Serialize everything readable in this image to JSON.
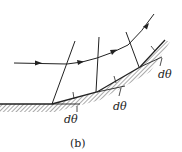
{
  "figure": {
    "caption": "(b)",
    "angle_labels": [
      "dθ",
      "dθ",
      "dθ"
    ],
    "colors": {
      "line": "#222222",
      "hatch": "#555555",
      "background": "#ffffff"
    }
  }
}
